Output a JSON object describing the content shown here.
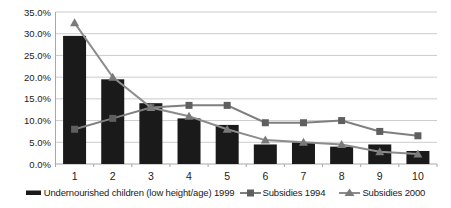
{
  "chart_data": {
    "type": "bar",
    "subtype": "combo-bar-line",
    "title": "",
    "xlabel": "",
    "ylabel": "",
    "categories": [
      "1",
      "2",
      "3",
      "4",
      "5",
      "6",
      "7",
      "8",
      "9",
      "10"
    ],
    "ylim": [
      0,
      35
    ],
    "ytick_step": 5,
    "ytick_labels": [
      "0.0%",
      "5.0%",
      "10.0%",
      "15.0%",
      "20.0%",
      "25.0%",
      "30.0%",
      "35.0%"
    ],
    "grid": true,
    "legend_position": "bottom",
    "series": [
      {
        "name": "Undernourished children (low height/age) 1999",
        "type": "bar",
        "color": "#1a1a1a",
        "values": [
          29.5,
          19.5,
          14.0,
          10.5,
          9.0,
          4.5,
          5.0,
          4.0,
          4.5,
          3.0
        ]
      },
      {
        "name": "Subsidies 1994",
        "type": "line",
        "marker": "square",
        "color": "#7f7f7f",
        "marker_color": "#5f5f5f",
        "values": [
          8.0,
          10.5,
          13.0,
          13.5,
          13.5,
          9.5,
          9.5,
          10.0,
          7.5,
          6.5
        ]
      },
      {
        "name": "Subsidies 2000",
        "type": "line",
        "marker": "triangle",
        "color": "#8c8c8c",
        "marker_color": "#7a7a7a",
        "values": [
          32.5,
          20.0,
          13.0,
          11.0,
          8.0,
          5.5,
          5.0,
          4.5,
          2.8,
          2.3
        ]
      }
    ],
    "axis_color": "#a8a8a8",
    "grid_color": "#cccccc",
    "background_color": "#ffffff"
  }
}
